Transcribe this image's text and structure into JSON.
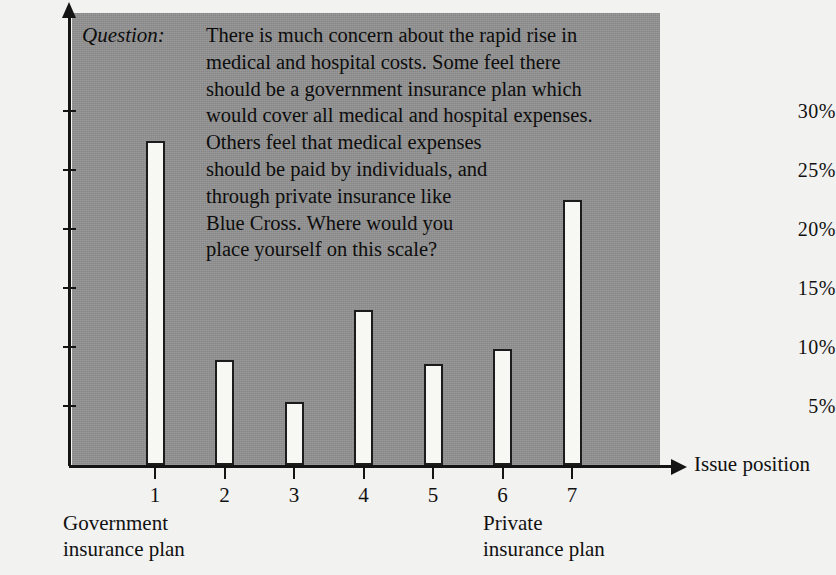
{
  "question": {
    "label": "Question:",
    "text": "There is much concern about the rapid rise in\nmedical and hospital costs. Some feel there\nshould be a government insurance plan which\nwould cover all medical and hospital expenses.\nOthers feel that medical expenses\nshould be paid by individuals, and\nthrough private insurance like\nBlue Cross. Where would you\nplace yourself on this scale?"
  },
  "axis": {
    "x_title": "Issue position",
    "left_caption": "Government\ninsurance plan",
    "right_caption": "Private\ninsurance plan"
  },
  "colors": {
    "panel": "#919191",
    "bar_fill": "#f7f7f3",
    "bar_stroke": "#1c1c1c",
    "axis": "#141414",
    "background": "#f2f2f0"
  },
  "chart_data": {
    "type": "bar",
    "title": "",
    "xlabel": "Issue position",
    "ylabel": "",
    "categories": [
      "1",
      "2",
      "3",
      "4",
      "5",
      "6",
      "7"
    ],
    "values": [
      27.5,
      8.9,
      5.3,
      13.1,
      8.6,
      9.8,
      22.5
    ],
    "ylim": [
      0,
      32
    ],
    "xlim": [
      0.5,
      7.5
    ],
    "ytick_values": [
      5,
      10,
      15,
      20,
      25,
      30
    ],
    "ytick_labels": [
      "5%",
      "10%",
      "15%",
      "20%",
      "25%",
      "30%"
    ],
    "xtick_labels": [
      "1",
      "2",
      "3",
      "4",
      "5",
      "6",
      "7"
    ],
    "grid": false,
    "legend": null,
    "annotations": [
      "Government insurance plan",
      "Private insurance plan"
    ]
  }
}
